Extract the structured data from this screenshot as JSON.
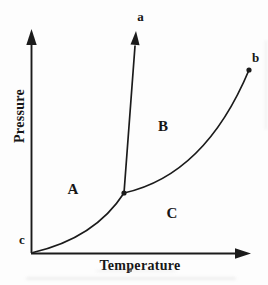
{
  "figure": {
    "colors": {
      "ink": "#1b1b1b",
      "background": "#fdfdfd"
    },
    "axes": {
      "y_label": "Pressure",
      "x_label": "Temperature"
    },
    "points": {
      "a": "a",
      "b": "b",
      "c": "c"
    },
    "regions": {
      "A": "A",
      "B": "B",
      "C": "C"
    },
    "geometry": {
      "y_axis": "M31.5 253 L31.5 44",
      "y_axis_arrow": "31.5,29 26.3,45 36.7,45",
      "x_axis": "M31 253.5 L236 253.5",
      "x_axis_arrow": "251,253.5 235,248.3 235,258.7",
      "curve_c_to_junction": "M33 252.5 Q95 238 124 193",
      "line_junction_to_a": "M124 193 L135 46",
      "arrow_to_a": "136,31 139.6,45.3 130.5,44.6",
      "curve_junction_to_b": "M124 193 Q205 175 249 70",
      "junction_dot": "M124 193 m -2.6 0 a 2.6 2.6 0 1 0 5.2 0 a 2.6 2.6 0 1 0 -5.2 0",
      "b_dot": "M249 70 m -2.6 0 a 2.6 2.6 0 1 0 5.2 0 a 2.6 2.6 0 1 0 -5.2 0"
    }
  }
}
